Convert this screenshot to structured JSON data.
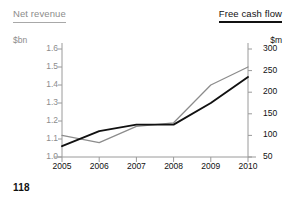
{
  "page": {
    "number": "118"
  },
  "header": {
    "left_title": "Net revenue",
    "right_title": "Free cash flow"
  },
  "axes": {
    "left_unit": "$bn",
    "right_unit": "$m",
    "left_ticks": [
      "1.6",
      "1.5",
      "1.4",
      "1.3",
      "1.2",
      "1.1",
      "1.0"
    ],
    "right_ticks": [
      "300",
      "250",
      "200",
      "150",
      "100",
      "50"
    ],
    "x_ticks": [
      "2005",
      "2006",
      "2007",
      "2008",
      "2009",
      "2010"
    ]
  },
  "colors": {
    "net_revenue_line": "#8c8c8c",
    "free_cash_flow_line": "#111111",
    "axis": "#9a9a9a",
    "text_muted": "#8c8c8c",
    "text_dark": "#111111",
    "background": "#ffffff"
  },
  "chart_data": {
    "type": "line",
    "title": "",
    "subtitle": "",
    "xlabel": "",
    "ylabel": "$bn",
    "y2label": "$m",
    "categories": [
      "2005",
      "2006",
      "2007",
      "2008",
      "2009",
      "2010"
    ],
    "x": [
      2005,
      2006,
      2007,
      2008,
      2009,
      2010
    ],
    "ylim": [
      1.0,
      1.6
    ],
    "y2lim": [
      50,
      300
    ],
    "yticks": [
      1.0,
      1.1,
      1.2,
      1.3,
      1.4,
      1.5,
      1.6
    ],
    "y2ticks": [
      50,
      100,
      150,
      200,
      250,
      300
    ],
    "grid": false,
    "legend": "top-headers",
    "series": [
      {
        "name": "Net revenue",
        "axis": "left",
        "unit": "$bn",
        "color": "#8c8c8c",
        "values": [
          1.12,
          1.08,
          1.17,
          1.19,
          1.4,
          1.5
        ]
      },
      {
        "name": "Free cash flow",
        "axis": "right",
        "unit": "$m",
        "color": "#111111",
        "values": [
          75,
          110,
          125,
          125,
          175,
          235
        ]
      }
    ]
  }
}
